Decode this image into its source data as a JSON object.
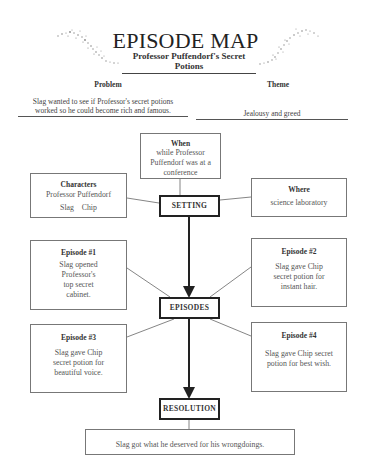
{
  "header": {
    "title": "EPISODE MAP",
    "subtitle": "Professor Puffendorf's Secret Potions"
  },
  "problem": {
    "label": "Problem",
    "lines": [
      "Slag wanted to see if Professor's secret potions",
      "worked so he could become rich and famous."
    ]
  },
  "theme": {
    "label": "Theme",
    "text": "Jealousy and greed"
  },
  "setting": {
    "hub_label": "SETTING",
    "when": {
      "heading": "When",
      "lines": [
        "while Professor",
        "Puffendorf was at a",
        "conference"
      ]
    },
    "characters": {
      "heading": "Characters",
      "lines": [
        "Professor Puffendorf",
        "Slag    Chip"
      ]
    },
    "where": {
      "heading": "Where",
      "lines": [
        "science laboratory"
      ]
    }
  },
  "episodes": {
    "hub_label": "EPISODES",
    "items": [
      {
        "heading": "Episode #1",
        "lines": [
          "Slag opened",
          "Professor's",
          "top secret",
          "cabinet."
        ]
      },
      {
        "heading": "Episode #2",
        "lines": [
          "Slag gave Chip",
          "secret potion for",
          "instant hair."
        ]
      },
      {
        "heading": "Episode #3",
        "lines": [
          "Slag gave Chip",
          "secret potion for",
          "beautiful voice."
        ]
      },
      {
        "heading": "Episode #4",
        "lines": [
          "Slag gave Chip secret",
          "potion for best wish."
        ]
      }
    ]
  },
  "resolution": {
    "hub_label": "RESOLUTION",
    "text": "Slag got what he deserved for his wrongdoings."
  },
  "colors": {
    "line": "#555555",
    "hub_border": "#222222",
    "box_border": "#777777",
    "text": "#333333"
  }
}
